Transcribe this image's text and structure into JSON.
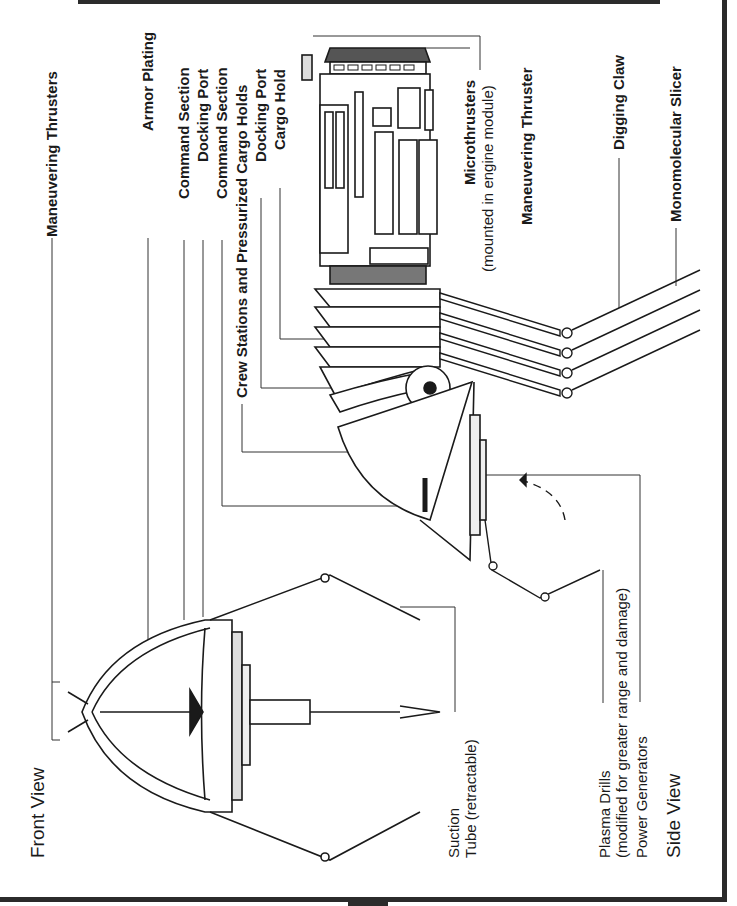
{
  "diagram": {
    "views": [
      {
        "id": "front",
        "title": "Front View"
      },
      {
        "id": "side",
        "title": "Side View"
      }
    ],
    "labels": {
      "maneuvering_thrusters": "Maneuvering Thrusters",
      "armor_plating": "Armor Plating",
      "command_section_1": "Command Section",
      "docking_port_1": "Docking Port",
      "command_section_2": "Command Section",
      "crew_stations": "Crew Stations and Pressurized Cargo Holds",
      "docking_port_2": "Docking Port",
      "cargo_hold": "Cargo Hold",
      "microthrusters": "Microthrusters",
      "microthrusters_note": "(mounted in engine module)",
      "maneuvering_thruster": "Maneuvering Thruster",
      "digging_claw": "Digging Claw",
      "monomolecular_slicer": "Monomolecular Slicer",
      "suction_tube_1": "Suction",
      "suction_tube_2": "Tube (retractable)",
      "plasma_drills": "Plasma Drills",
      "plasma_drills_note": "(modified for greater range and damage)",
      "power_generators": "Power Generators"
    },
    "colors": {
      "ink": "#1a1a1a",
      "border": "#2b2b2b",
      "hatch": "#555555",
      "paper": "#ffffff"
    }
  }
}
